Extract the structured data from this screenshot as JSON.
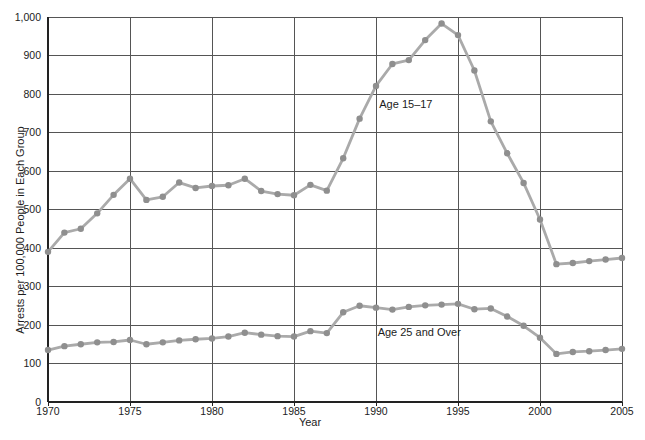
{
  "chart_data": {
    "type": "line",
    "title": "",
    "xlabel": "Year",
    "ylabel": "Arrests per 100,000 People in Each Group",
    "xlim": [
      1970,
      2005
    ],
    "ylim": [
      0,
      1000
    ],
    "grid": true,
    "legend_position": "inline-annotations",
    "x_tick_values": [
      1970,
      1975,
      1980,
      1985,
      1990,
      1995,
      2000,
      2005
    ],
    "x_tick_labels": [
      "1970",
      "1975",
      "1980",
      "1985",
      "1990",
      "1995",
      "2000",
      "2005"
    ],
    "y_tick_values": [
      0,
      100,
      200,
      300,
      400,
      500,
      600,
      700,
      800,
      900,
      1000
    ],
    "y_tick_labels": [
      "0",
      "100",
      "200",
      "300",
      "400",
      "500",
      "600",
      "700",
      "800",
      "900",
      "1,000"
    ],
    "x": [
      1970,
      1971,
      1972,
      1973,
      1974,
      1975,
      1976,
      1977,
      1978,
      1979,
      1980,
      1981,
      1982,
      1983,
      1984,
      1985,
      1986,
      1987,
      1988,
      1989,
      1990,
      1991,
      1992,
      1993,
      1994,
      1995,
      1996,
      1997,
      1998,
      1999,
      2000,
      2001,
      2002,
      2003,
      2004,
      2005
    ],
    "series": [
      {
        "name": "Age 15–17",
        "values": [
          390,
          440,
          450,
          490,
          538,
          580,
          525,
          533,
          570,
          556,
          561,
          563,
          580,
          548,
          540,
          537,
          564,
          549,
          633,
          736,
          821,
          878,
          888,
          940,
          983,
          953,
          861,
          729,
          646,
          569,
          474,
          358,
          361,
          366,
          370,
          374
        ]
      },
      {
        "name": "Age 25 and Over",
        "values": [
          135,
          145,
          150,
          155,
          156,
          161,
          150,
          155,
          160,
          163,
          165,
          170,
          180,
          175,
          171,
          170,
          184,
          179,
          233,
          250,
          245,
          240,
          247,
          251,
          253,
          255,
          241,
          243,
          222,
          198,
          167,
          125,
          130,
          132,
          135,
          138
        ]
      }
    ],
    "annotations": [
      {
        "text": "Age 15–17",
        "x": 1990.2,
        "y": 764,
        "anchor": "start"
      },
      {
        "text": "Age 25 and Over",
        "x": 1990.1,
        "y": 171,
        "anchor": "start"
      }
    ],
    "colors": {
      "line": "#aaaaaa",
      "marker": "#8f8f8f",
      "grid": "#555555",
      "axis": "#222222",
      "text": "#1c1c1c",
      "background": "#ffffff"
    }
  }
}
